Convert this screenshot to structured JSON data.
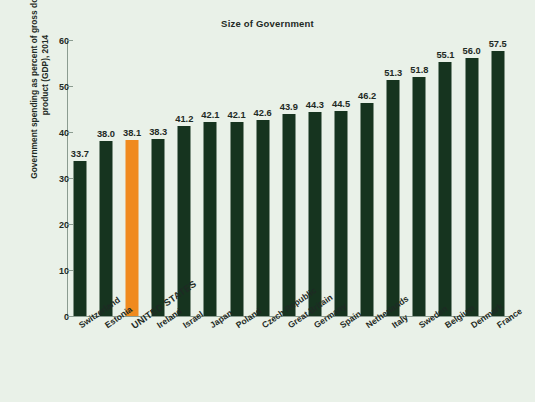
{
  "chart_data": {
    "type": "bar",
    "title": "Size of Government",
    "xlabel": "",
    "ylabel": "Government spending as percent of gross domestic product (GDP), 2014",
    "ylim": [
      0,
      60
    ],
    "yticks": [
      0,
      10,
      20,
      30,
      40,
      50,
      60
    ],
    "ytick_labels": [
      "0",
      "10",
      "20",
      "30",
      "40",
      "50",
      "60"
    ],
    "grid": false,
    "legend": "none",
    "categories": [
      "Switzerland",
      "Estonia",
      "UNITED STATES",
      "Ireland",
      "Israel",
      "Japan",
      "Poland",
      "Czech Republic",
      "Great Britain",
      "Germany",
      "Spain",
      "Netherlands",
      "Italy",
      "Sweden",
      "Belgium",
      "Denmark",
      "France"
    ],
    "values": [
      33.7,
      38.0,
      38.1,
      38.3,
      41.2,
      42.1,
      42.1,
      42.6,
      43.9,
      44.3,
      44.5,
      46.2,
      51.3,
      51.8,
      55.1,
      56.0,
      57.5
    ],
    "value_labels": [
      "33.7",
      "38.0",
      "38.1",
      "38.3",
      "41.2",
      "42.1",
      "42.1",
      "42.6",
      "43.9",
      "44.3",
      "44.5",
      "46.2",
      "51.3",
      "51.8",
      "55.1",
      "56.0",
      "57.5"
    ],
    "highlight_index": 2,
    "colors": {
      "bar": "#16341f",
      "bar_highlight": "#f08a1e",
      "background": "#e9f1e8",
      "axis": "#8b9c90",
      "text": "#1e2a24"
    }
  }
}
